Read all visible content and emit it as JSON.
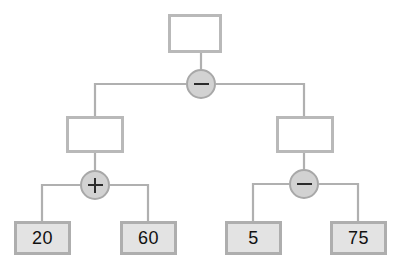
{
  "diagram": {
    "type": "binary-expression-tree",
    "canvas": {
      "width": 403,
      "height": 267,
      "background": "#ffffff"
    },
    "colors": {
      "box_border": "#b9b9b9",
      "box_fill": "#ffffff",
      "leaf_border": "#aeaeae",
      "leaf_fill": "#e3e3e3",
      "circle_fill": "#d2d2d2",
      "circle_border": "#a8a8a8",
      "edge": "#b0b0b0",
      "text": "#111111"
    },
    "nodes": {
      "root_box": {
        "label": "",
        "x": 168,
        "y": 14,
        "w": 54,
        "h": 39,
        "kind": "empty-box"
      },
      "root_op": {
        "label": "−",
        "glyph": "minus",
        "cx": 201,
        "cy": 84,
        "r": 15
      },
      "left_box": {
        "label": "",
        "x": 66,
        "y": 116,
        "w": 58,
        "h": 37,
        "kind": "empty-box"
      },
      "left_op": {
        "label": "+",
        "glyph": "plus",
        "cx": 95,
        "cy": 185,
        "r": 15
      },
      "right_box": {
        "label": "",
        "x": 276,
        "y": 116,
        "w": 58,
        "h": 37,
        "kind": "empty-box"
      },
      "right_op": {
        "label": "−",
        "glyph": "minus",
        "cx": 304,
        "cy": 184,
        "r": 15
      },
      "leaf_1": {
        "label": "20",
        "x": 14,
        "y": 221,
        "w": 57,
        "h": 34
      },
      "leaf_2": {
        "label": "60",
        "x": 120,
        "y": 221,
        "w": 57,
        "h": 34
      },
      "leaf_3": {
        "label": "5",
        "x": 225,
        "y": 221,
        "w": 57,
        "h": 34
      },
      "leaf_4": {
        "label": "75",
        "x": 330,
        "y": 221,
        "w": 57,
        "h": 34
      }
    },
    "edges": [
      {
        "name": "root-box-to-root-op",
        "d": "M 201 53 L 201 69"
      },
      {
        "name": "root-op-left-branch",
        "d": "M 186 84 L 95 84 L 95 116"
      },
      {
        "name": "root-op-right-branch",
        "d": "M 216 84 L 304 84 L 304 116"
      },
      {
        "name": "left-box-to-left-op",
        "d": "M 95 153 L 95 170"
      },
      {
        "name": "left-op-to-leaf-1",
        "d": "M 80 185 L 42 185 L 42 221"
      },
      {
        "name": "left-op-to-leaf-2",
        "d": "M 110 185 L 148 185 L 148 221"
      },
      {
        "name": "right-box-to-right-op",
        "d": "M 304 153 L 304 169"
      },
      {
        "name": "right-op-to-leaf-3",
        "d": "M 289 184 L 253 184 L 253 221"
      },
      {
        "name": "right-op-to-leaf-4",
        "d": "M 319 184 L 358 184 L 358 221"
      }
    ]
  }
}
